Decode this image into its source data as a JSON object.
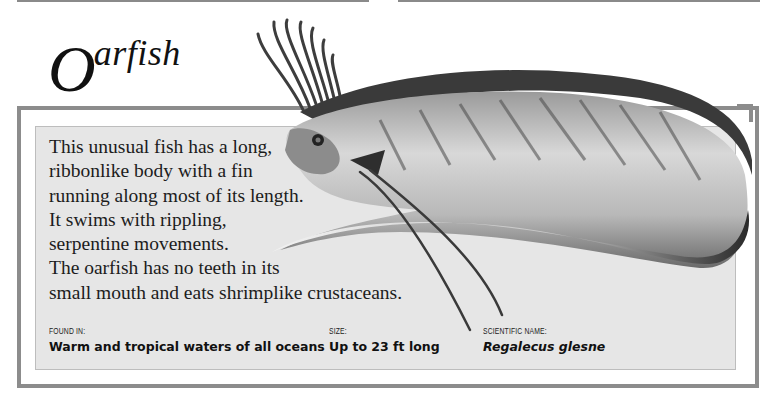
{
  "page": {
    "title_initial": "O",
    "title_rest": "arfish",
    "description_lines": [
      "This unusual fish has a long,",
      "ribbonlike body with a fin",
      "running along most of its length.",
      "It swims with rippling,",
      "serpentine movements.",
      "The oarfish has no teeth in its",
      "small mouth and eats shrimplike crustaceans."
    ],
    "facts": {
      "found_in": {
        "label": "Found in:",
        "value": "Warm and tropical waters of all oceans"
      },
      "size": {
        "label": "Size:",
        "value": "Up to 23 ft long"
      },
      "scientific_name": {
        "label": "Scientific name:",
        "value": "Regalecus glesne"
      }
    },
    "illustration": {
      "subject": "oarfish-illustration"
    },
    "colors": {
      "frame": "#8c8c8c",
      "panel": "#e6e6e6",
      "fin": "#3a3a3a"
    }
  }
}
